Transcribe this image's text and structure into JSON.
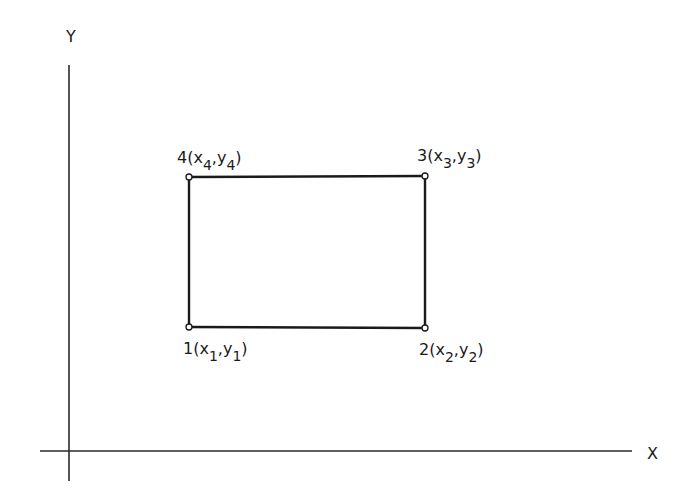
{
  "diagram": {
    "axes": {
      "x_label": "X",
      "y_label": "Y"
    },
    "shape": "rectangle",
    "vertices": [
      {
        "id": "1",
        "label_prefix": "1(",
        "x_var": "x",
        "x_sub": "1",
        "sep": ",",
        "y_var": "y",
        "y_sub": "1",
        "suffix": ")"
      },
      {
        "id": "2",
        "label_prefix": "2(",
        "x_var": "x",
        "x_sub": "2",
        "sep": ",",
        "y_var": "y",
        "y_sub": "2",
        "suffix": ")"
      },
      {
        "id": "3",
        "label_prefix": "3(",
        "x_var": "x",
        "x_sub": "3",
        "sep": ",",
        "y_var": "y",
        "y_sub": "3",
        "suffix": ")"
      },
      {
        "id": "4",
        "label_prefix": "4(",
        "x_var": "x",
        "x_sub": "4",
        "sep": ",",
        "y_var": "y",
        "y_sub": "4",
        "suffix": ")"
      }
    ]
  }
}
